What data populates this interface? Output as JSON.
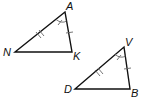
{
  "diagram": {
    "type": "congruent-triangles",
    "triangles": [
      {
        "name": "triangle-NAK",
        "vertices": [
          {
            "label": "N",
            "x": 15,
            "y": 52
          },
          {
            "label": "A",
            "x": 65,
            "y": 12
          },
          {
            "label": "K",
            "x": 72,
            "y": 52
          }
        ],
        "marks": {
          "side_NA": "double-tick",
          "side_AK": "single-tick",
          "angle_A": "single-arc-tick"
        }
      },
      {
        "name": "triangle-DVB",
        "vertices": [
          {
            "label": "D",
            "x": 75,
            "y": 89
          },
          {
            "label": "V",
            "x": 124,
            "y": 47
          },
          {
            "label": "B",
            "x": 130,
            "y": 89
          }
        ],
        "marks": {
          "side_DV": "double-tick",
          "side_VB": "single-tick",
          "angle_V": "single-arc-tick"
        }
      }
    ],
    "labels": {
      "N": "N",
      "A": "A",
      "K": "K",
      "D": "D",
      "V": "V",
      "B": "B"
    },
    "colors": {
      "stroke": "#111111",
      "tick": "#666666",
      "background": "#ffffff"
    }
  }
}
